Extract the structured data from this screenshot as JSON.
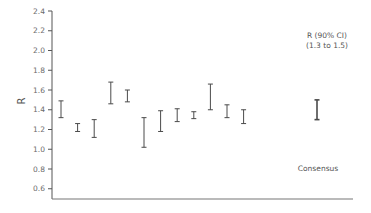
{
  "chart_data": {
    "type": "errorbar",
    "title": "",
    "xlabel": "",
    "ylabel": "R",
    "ylim": [
      0.5,
      2.4
    ],
    "yticks": [
      0.6,
      0.8,
      1.0,
      1.2,
      1.4,
      1.6,
      1.8,
      2.0,
      2.2,
      2.4
    ],
    "ytick_labels": [
      "0.6",
      "0.8",
      "1.0",
      "1.2",
      "1.4",
      "1.6",
      "1.8",
      "2.0",
      "2.2",
      "2.4"
    ],
    "grid": false,
    "legend": null,
    "series": [
      {
        "name": "Estimates",
        "intervals": [
          {
            "x": 1,
            "low": 1.32,
            "high": 1.49
          },
          {
            "x": 2,
            "low": 1.18,
            "high": 1.26
          },
          {
            "x": 3,
            "low": 1.12,
            "high": 1.3
          },
          {
            "x": 4,
            "low": 1.46,
            "high": 1.68
          },
          {
            "x": 5,
            "low": 1.48,
            "high": 1.6
          },
          {
            "x": 6,
            "low": 1.02,
            "high": 1.32
          },
          {
            "x": 7,
            "low": 1.18,
            "high": 1.39
          },
          {
            "x": 8,
            "low": 1.28,
            "high": 1.41
          },
          {
            "x": 9,
            "low": 1.31,
            "high": 1.38
          },
          {
            "x": 10,
            "low": 1.4,
            "high": 1.66
          },
          {
            "x": 11,
            "low": 1.32,
            "high": 1.45
          },
          {
            "x": 12,
            "low": 1.26,
            "high": 1.4
          }
        ]
      },
      {
        "name": "Consensus",
        "intervals": [
          {
            "x": 16,
            "low": 1.3,
            "high": 1.5
          }
        ]
      }
    ],
    "annotations": [
      {
        "text": "R (90% CI)",
        "position": "top-right"
      },
      {
        "text": "(1.3 to 1.5)",
        "position": "top-right"
      },
      {
        "text": "Consensus",
        "position": "bottom-right"
      }
    ]
  },
  "labels": {
    "ylabel": "R",
    "annotation_line1": "R (90% CI)",
    "annotation_line2": "(1.3 to 1.5)",
    "consensus_label": "Consensus"
  },
  "colors": {
    "axis": "#555555",
    "bar": "#4a4a4a",
    "text": "#6b6b6b"
  }
}
